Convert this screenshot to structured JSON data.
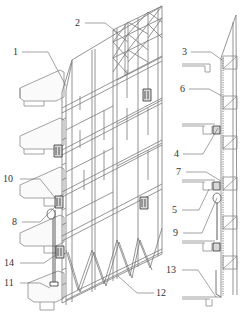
{
  "figure": {
    "colors": {
      "line": "#8a8a8a",
      "frame": "#7a7a7a",
      "dark": "#333333",
      "slab": "#9a9a9a",
      "background": "#ffffff"
    }
  },
  "callouts": [
    {
      "id": "1",
      "label": "1",
      "x": 13,
      "y": 47,
      "lx1": 22,
      "ly1": 52,
      "lx2": 48,
      "ly2": 52,
      "lx3": 66,
      "ly3": 86
    },
    {
      "id": "2",
      "label": "2",
      "x": 75,
      "y": 18,
      "lx1": 85,
      "ly1": 23,
      "lx2": 105,
      "ly2": 23,
      "lx3": 118,
      "ly3": 33
    },
    {
      "id": "3",
      "label": "3",
      "x": 182,
      "y": 47,
      "lx1": 191,
      "ly1": 52,
      "lx2": 211,
      "ly2": 52,
      "lx3": 222,
      "ly3": 60
    },
    {
      "id": "6",
      "label": "6",
      "x": 180,
      "y": 84,
      "lx1": 189,
      "ly1": 89,
      "lx2": 209,
      "ly2": 89,
      "lx3": 222,
      "ly3": 96
    },
    {
      "id": "4",
      "label": "4",
      "x": 174,
      "y": 149,
      "lx1": 183,
      "ly1": 154,
      "lx2": 203,
      "ly2": 154,
      "lx3": 218,
      "ly3": 128
    },
    {
      "id": "10",
      "label": "10",
      "x": 3,
      "y": 174,
      "lx1": 20,
      "ly1": 179,
      "lx2": 40,
      "ly2": 179,
      "lx3": 56,
      "ly3": 199
    },
    {
      "id": "7",
      "label": "7",
      "x": 176,
      "y": 167,
      "lx1": 186,
      "ly1": 172,
      "lx2": 206,
      "ly2": 172,
      "lx3": 221,
      "ly3": 181
    },
    {
      "id": "5",
      "label": "5",
      "x": 172,
      "y": 205,
      "lx1": 182,
      "ly1": 210,
      "lx2": 199,
      "ly2": 210,
      "lx3": 209,
      "ly3": 189
    },
    {
      "id": "8",
      "label": "8",
      "x": 12,
      "y": 217,
      "lx1": 22,
      "ly1": 222,
      "lx2": 40,
      "ly2": 222,
      "lx3": 57,
      "ly3": 205
    },
    {
      "id": "9",
      "label": "9",
      "x": 173,
      "y": 228,
      "lx1": 183,
      "ly1": 233,
      "lx2": 202,
      "ly2": 233,
      "lx3": 217,
      "ly3": 198
    },
    {
      "id": "14",
      "label": "14",
      "x": 4,
      "y": 258,
      "lx1": 20,
      "ly1": 263,
      "lx2": 44,
      "ly2": 263,
      "lx3": 57,
      "ly3": 254
    },
    {
      "id": "11",
      "label": "11",
      "x": 4,
      "y": 278,
      "lx1": 20,
      "ly1": 283,
      "lx2": 40,
      "ly2": 283,
      "lx3": 50,
      "ly3": 288
    },
    {
      "id": "12",
      "label": "12",
      "x": 156,
      "y": 288,
      "lx1": 154,
      "ly1": 293,
      "lx2": 137,
      "ly2": 293,
      "lx3": 118,
      "ly3": 276
    },
    {
      "id": "13",
      "label": "13",
      "x": 166,
      "y": 265,
      "lx1": 182,
      "ly1": 270,
      "lx2": 198,
      "ly2": 270,
      "lx3": 216,
      "ly3": 297
    }
  ]
}
